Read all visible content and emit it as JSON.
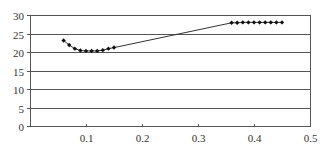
{
  "chart_data": {
    "type": "line",
    "title": "",
    "xlabel": "",
    "ylabel": "",
    "xlim": [
      0,
      0.5
    ],
    "ylim": [
      0,
      30
    ],
    "x_ticks": [
      0.1,
      0.2,
      0.3,
      0.4,
      0.5
    ],
    "x_tick_labels": [
      "0.1",
      "0.2",
      "0.3",
      "0.4",
      "0.5"
    ],
    "y_ticks": [
      0,
      5,
      10,
      15,
      20,
      25,
      30
    ],
    "y_tick_labels": [
      "0",
      "5",
      "10",
      "15",
      "20",
      "25",
      "30"
    ],
    "grid": {
      "horizontal": true,
      "vertical": false
    },
    "legend": null,
    "series": [
      {
        "name": "series-1",
        "marker": "diamond",
        "color": "#000000",
        "x": [
          0.06,
          0.07,
          0.08,
          0.09,
          0.1,
          0.11,
          0.12,
          0.13,
          0.14,
          0.15,
          0.36,
          0.37,
          0.38,
          0.39,
          0.4,
          0.41,
          0.42,
          0.43,
          0.44,
          0.45
        ],
        "y": [
          23.1,
          21.9,
          20.9,
          20.4,
          20.3,
          20.3,
          20.3,
          20.5,
          20.9,
          21.2,
          27.9,
          27.9,
          28.0,
          28.0,
          28.0,
          28.0,
          28.0,
          28.0,
          28.0,
          28.0
        ]
      }
    ]
  },
  "style": {
    "axis_color": "#555555",
    "grid_color": "#555555",
    "line_color": "#333333",
    "marker_color": "#111111"
  }
}
